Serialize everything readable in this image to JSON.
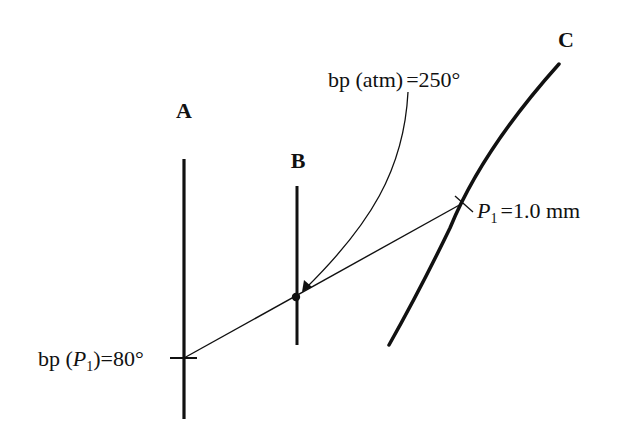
{
  "diagram": {
    "type": "nomograph",
    "colors": {
      "ink": "#111111",
      "background": "#ffffff"
    },
    "scales": [
      {
        "id": "A",
        "label": "A"
      },
      {
        "id": "B",
        "label": "B"
      },
      {
        "id": "C",
        "label": "C"
      }
    ],
    "annotations": {
      "bp_atm": {
        "prefix": "bp (atm)",
        "equals": "=",
        "value": "250°"
      },
      "p1": {
        "symbol": "P",
        "subscript": "1",
        "equals": "=",
        "value": "1.0 mm"
      },
      "bp_p1": {
        "prefix": "bp (",
        "symbol": "P",
        "subscript": "1",
        "suffix": ")",
        "equals": "=",
        "value": "80°"
      }
    },
    "markers": {
      "scale_a_tick": "tick-mark",
      "scale_b_point": "dot",
      "scale_c_point": "x-mark"
    }
  }
}
